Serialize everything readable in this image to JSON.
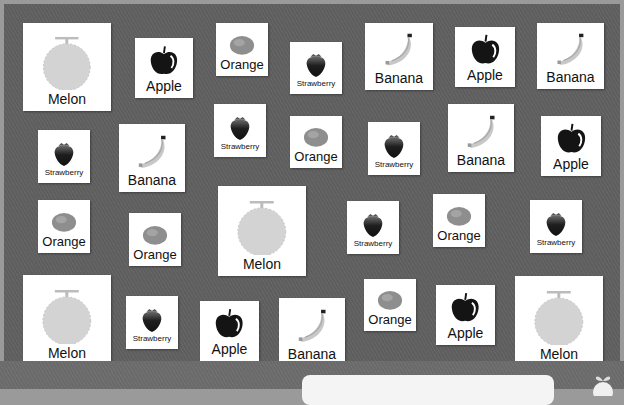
{
  "game": {
    "colors": {
      "board": "#5e5e5e",
      "card": "#ffffff",
      "frame": "#9a9a9a"
    },
    "cards": [
      {
        "fruit": "melon",
        "label": "Melon",
        "x": 23,
        "y": 23,
        "w": 88,
        "h": 88,
        "fs": 14
      },
      {
        "fruit": "apple",
        "label": "Apple",
        "x": 135,
        "y": 38,
        "w": 58,
        "h": 60,
        "fs": 14
      },
      {
        "fruit": "orange",
        "label": "Orange",
        "x": 216,
        "y": 23,
        "w": 52,
        "h": 53,
        "fs": 13
      },
      {
        "fruit": "strawberry",
        "label": "Strawberry",
        "x": 290,
        "y": 42,
        "w": 52,
        "h": 52,
        "fs": 8
      },
      {
        "fruit": "banana",
        "label": "Banana",
        "x": 365,
        "y": 23,
        "w": 68,
        "h": 67,
        "fs": 14
      },
      {
        "fruit": "apple",
        "label": "Apple",
        "x": 455,
        "y": 27,
        "w": 60,
        "h": 60,
        "fs": 14
      },
      {
        "fruit": "banana",
        "label": "Banana",
        "x": 537,
        "y": 23,
        "w": 67,
        "h": 66,
        "fs": 14
      },
      {
        "fruit": "strawberry",
        "label": "Strawberry",
        "x": 38,
        "y": 130,
        "w": 52,
        "h": 53,
        "fs": 8
      },
      {
        "fruit": "banana",
        "label": "Banana",
        "x": 119,
        "y": 124,
        "w": 66,
        "h": 68,
        "fs": 14
      },
      {
        "fruit": "strawberry",
        "label": "Strawberry",
        "x": 214,
        "y": 104,
        "w": 52,
        "h": 53,
        "fs": 8
      },
      {
        "fruit": "orange",
        "label": "Orange",
        "x": 290,
        "y": 116,
        "w": 52,
        "h": 52,
        "fs": 13
      },
      {
        "fruit": "strawberry",
        "label": "Strawberry",
        "x": 368,
        "y": 122,
        "w": 52,
        "h": 53,
        "fs": 8
      },
      {
        "fruit": "banana",
        "label": "Banana",
        "x": 448,
        "y": 104,
        "w": 66,
        "h": 68,
        "fs": 14
      },
      {
        "fruit": "apple",
        "label": "Apple",
        "x": 541,
        "y": 116,
        "w": 60,
        "h": 60,
        "fs": 14
      },
      {
        "fruit": "orange",
        "label": "Orange",
        "x": 38,
        "y": 200,
        "w": 52,
        "h": 53,
        "fs": 13
      },
      {
        "fruit": "orange",
        "label": "Orange",
        "x": 129,
        "y": 213,
        "w": 52,
        "h": 53,
        "fs": 13
      },
      {
        "fruit": "melon",
        "label": "Melon",
        "x": 218,
        "y": 186,
        "w": 88,
        "h": 90,
        "fs": 14
      },
      {
        "fruit": "strawberry",
        "label": "Strawberry",
        "x": 347,
        "y": 201,
        "w": 52,
        "h": 53,
        "fs": 8
      },
      {
        "fruit": "orange",
        "label": "Orange",
        "x": 433,
        "y": 194,
        "w": 52,
        "h": 53,
        "fs": 13
      },
      {
        "fruit": "strawberry",
        "label": "Strawberry",
        "x": 530,
        "y": 200,
        "w": 52,
        "h": 53,
        "fs": 8
      },
      {
        "fruit": "melon",
        "label": "Melon",
        "x": 23,
        "y": 275,
        "w": 88,
        "h": 90,
        "fs": 14
      },
      {
        "fruit": "strawberry",
        "label": "Strawberry",
        "x": 126,
        "y": 296,
        "w": 52,
        "h": 53,
        "fs": 8
      },
      {
        "fruit": "apple",
        "label": "Apple",
        "x": 200,
        "y": 301,
        "w": 59,
        "h": 60,
        "fs": 14
      },
      {
        "fruit": "banana",
        "label": "Banana",
        "x": 279,
        "y": 298,
        "w": 66,
        "h": 68,
        "fs": 14
      },
      {
        "fruit": "orange",
        "label": "Orange",
        "x": 364,
        "y": 279,
        "w": 52,
        "h": 52,
        "fs": 13
      },
      {
        "fruit": "apple",
        "label": "Apple",
        "x": 436,
        "y": 285,
        "w": 59,
        "h": 60,
        "fs": 14
      },
      {
        "fruit": "melon",
        "label": "Melon",
        "x": 515,
        "y": 276,
        "w": 88,
        "h": 90,
        "fs": 14
      }
    ]
  }
}
